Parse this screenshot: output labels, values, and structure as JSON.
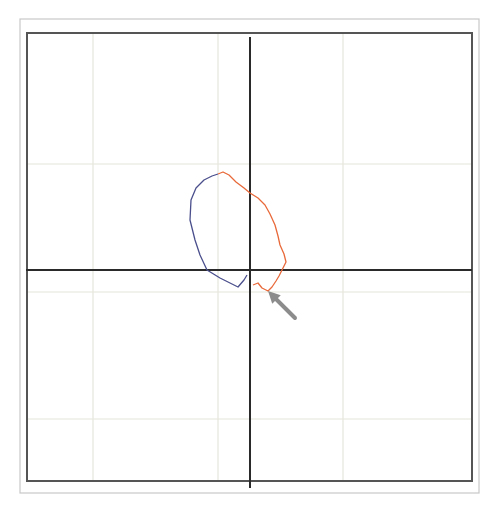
{
  "figure": {
    "colors": {
      "background": "#ffffff",
      "outer_frame": "#c8c8c8",
      "inner_frame": "#555555",
      "grid": "#e6e6dc",
      "axes": "#2a2a2a",
      "curve_blue": "#4a4f8c",
      "curve_orange": "#e8693a",
      "arrow": "#8c8c8c"
    },
    "frame": {
      "outer": {
        "x": 20,
        "y": 19,
        "w": 459,
        "h": 474
      },
      "inner": {
        "x": 27,
        "y": 33,
        "w": 445,
        "h": 448
      }
    },
    "grid": {
      "vertical_x": [
        93,
        218,
        343
      ],
      "horizontal_y": [
        164,
        292,
        419
      ]
    },
    "axes": {
      "x_axis_y": 270,
      "y_axis_x": 250
    },
    "curves": [
      {
        "name": "blue-segment",
        "color": "#4a4f8c",
        "points": [
          [
            247,
            275
          ],
          [
            244,
            280
          ],
          [
            238,
            287
          ],
          [
            220,
            278
          ],
          [
            207,
            270
          ],
          [
            200,
            255
          ],
          [
            195,
            240
          ],
          [
            190,
            220
          ],
          [
            191,
            200
          ],
          [
            196,
            188
          ],
          [
            204,
            180
          ],
          [
            212,
            176
          ],
          [
            218,
            174
          ]
        ]
      },
      {
        "name": "orange-segment",
        "color": "#e8693a",
        "points": [
          [
            218,
            174
          ],
          [
            223,
            172
          ],
          [
            229,
            175
          ],
          [
            236,
            182
          ],
          [
            244,
            188
          ],
          [
            250,
            193
          ],
          [
            258,
            198
          ],
          [
            265,
            205
          ],
          [
            270,
            214
          ],
          [
            275,
            225
          ],
          [
            278,
            236
          ],
          [
            280,
            245
          ],
          [
            284,
            254
          ],
          [
            286,
            262
          ],
          [
            282,
            270
          ],
          [
            279,
            276
          ],
          [
            276,
            281
          ],
          [
            272,
            287
          ],
          [
            268,
            291
          ],
          [
            262,
            288
          ],
          [
            258,
            283
          ],
          [
            253,
            285
          ]
        ]
      }
    ],
    "arrow": {
      "tail": [
        295,
        318
      ],
      "tip": [
        268,
        291
      ],
      "color": "#8c8c8c"
    }
  }
}
